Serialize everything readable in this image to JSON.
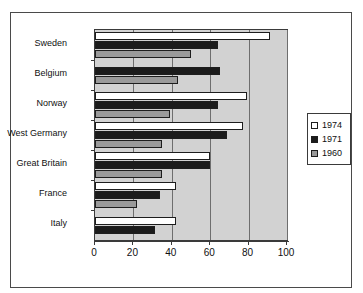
{
  "chart_data": {
    "type": "bar",
    "orientation": "horizontal",
    "title": "",
    "xlabel": "",
    "ylabel": "",
    "xlim": [
      0,
      100
    ],
    "xticks": [
      "0",
      "20",
      "40",
      "60",
      "80",
      "100"
    ],
    "grid": true,
    "legend_position": "right",
    "categories": [
      "Sweden",
      "Belgium",
      "Norway",
      "West Germany",
      "Great Britain",
      "France",
      "Italy"
    ],
    "series": [
      {
        "name": "1974",
        "color": "#ffffff",
        "values": [
          91,
          null,
          79,
          77,
          60,
          42,
          42
        ]
      },
      {
        "name": "1971",
        "color": "#1b1b1b",
        "values": [
          64,
          65,
          64,
          69,
          60,
          34,
          31
        ]
      },
      {
        "name": "1960",
        "color": "#9a9a9a",
        "values": [
          50,
          43,
          39,
          35,
          35,
          22,
          null
        ]
      }
    ]
  },
  "legend": {
    "entries": [
      {
        "label": "1974"
      },
      {
        "label": "1971"
      },
      {
        "label": "1960"
      }
    ]
  },
  "colors": {
    "plot_background": "#d2d2d2",
    "gridline": "#6e6e6e",
    "axis": "#3a3a3a",
    "frame": "#4a4a4a"
  }
}
